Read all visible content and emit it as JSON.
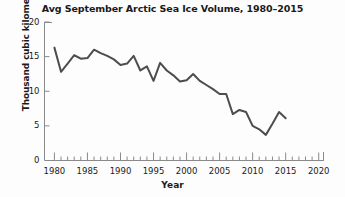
{
  "chart_data": {
    "type": "line",
    "title": "Avg September Arctic Sea Ice Volume, 1980–2015",
    "xlabel": "Year",
    "ylabel": "Thousand cubic kilometers",
    "xlim": [
      1978.5,
      2020.8
    ],
    "ylim": [
      0,
      20
    ],
    "grid": false,
    "legend": null,
    "x_major_ticks": [
      1980,
      1985,
      1990,
      1995,
      2000,
      2005,
      2010,
      2015,
      2020
    ],
    "x_major_tick_labels": [
      "1980",
      "1985",
      "1990",
      "1995",
      "2000",
      "2005",
      "2010",
      "2015",
      "2020"
    ],
    "x_minor_tick_step": 1,
    "y_major_ticks": [
      0,
      5,
      10,
      15,
      20
    ],
    "y_major_tick_labels": [
      "0",
      "5",
      "10",
      "15",
      "20"
    ],
    "line_color": "#4d4d4d",
    "line_width": 2.0,
    "series": [
      {
        "name": "Avg September Arctic sea ice volume",
        "x": [
          1980,
          1981,
          1982,
          1983,
          1984,
          1985,
          1986,
          1987,
          1988,
          1989,
          1990,
          1991,
          1992,
          1993,
          1994,
          1995,
          1996,
          1997,
          1998,
          1999,
          2000,
          2001,
          2002,
          2003,
          2004,
          2005,
          2006,
          2007,
          2008,
          2009,
          2010,
          2011,
          2012,
          2013,
          2014,
          2015
        ],
        "values": [
          16.3,
          12.8,
          14.0,
          15.2,
          14.7,
          14.8,
          16.0,
          15.5,
          15.1,
          14.6,
          13.8,
          14.0,
          15.1,
          13.0,
          13.6,
          11.5,
          14.1,
          13.0,
          12.3,
          11.4,
          11.6,
          12.5,
          11.5,
          10.9,
          10.3,
          9.6,
          9.6,
          6.7,
          7.3,
          7.0,
          5.0,
          4.5,
          3.7,
          5.3,
          7.0,
          6.1
        ]
      }
    ]
  }
}
